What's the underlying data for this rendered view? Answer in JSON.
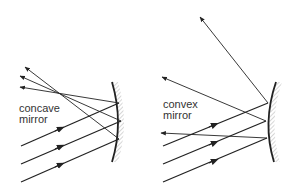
{
  "diagrams": [
    {
      "name": "concave",
      "label_line1": "concave",
      "label_line2": "mirror"
    },
    {
      "name": "convex",
      "label_line1": "convex",
      "label_line2": "mirror"
    }
  ],
  "colors": {
    "line": "#222222",
    "text": "#333333",
    "hatch": "#888888",
    "background": "#ffffff"
  }
}
